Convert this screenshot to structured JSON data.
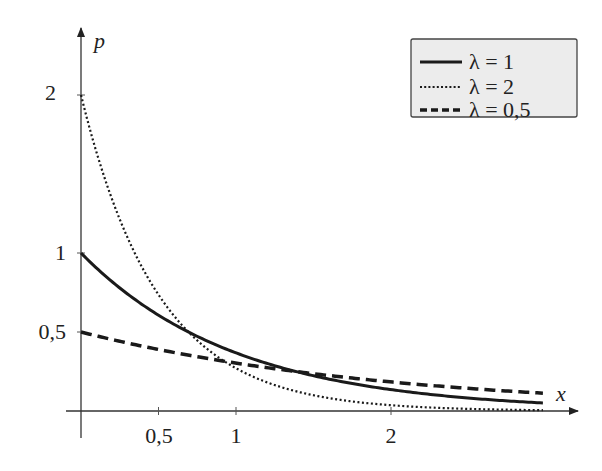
{
  "chart_data": {
    "type": "line",
    "title": "",
    "xlabel": "x",
    "ylabel": "p",
    "xlim": [
      0,
      3.2
    ],
    "ylim": [
      0,
      2.4
    ],
    "x_ticks": [
      0.5,
      1,
      2
    ],
    "x_tick_labels": [
      "0,5",
      "1",
      "2"
    ],
    "y_ticks": [
      0.5,
      1,
      2
    ],
    "y_tick_labels": [
      "0,5",
      "1",
      "2"
    ],
    "grid": false,
    "legend_position": "upper right",
    "function": "p(x) = λ·e^(−λx)",
    "x": [
      0,
      0.25,
      0.5,
      0.75,
      1.0,
      1.25,
      1.5,
      1.75,
      2.0,
      2.25,
      2.5,
      2.75,
      2.98
    ],
    "series": [
      {
        "name": "λ = 1",
        "lambda": 1,
        "style": "solid",
        "values": [
          1.0,
          0.779,
          0.607,
          0.472,
          0.368,
          0.287,
          0.223,
          0.174,
          0.135,
          0.105,
          0.082,
          0.064,
          0.051
        ]
      },
      {
        "name": "λ = 2",
        "lambda": 2,
        "style": "dotted",
        "values": [
          2.0,
          1.213,
          0.736,
          0.446,
          0.271,
          0.164,
          0.1,
          0.06,
          0.037,
          0.022,
          0.013,
          0.008,
          0.005
        ]
      },
      {
        "name": "λ = 0,5",
        "lambda": 0.5,
        "style": "dashed",
        "values": [
          0.5,
          0.441,
          0.389,
          0.344,
          0.303,
          0.268,
          0.236,
          0.208,
          0.184,
          0.162,
          0.143,
          0.126,
          0.113
        ]
      }
    ]
  },
  "axes": {
    "x_label": "x",
    "y_label": "p",
    "x_tick_labels": [
      "0,5",
      "1",
      "2"
    ],
    "y_tick_labels": [
      "0,5",
      "1",
      "2"
    ]
  },
  "legend": {
    "items": [
      {
        "label": "λ = 1",
        "style": "solid"
      },
      {
        "label": "λ = 2",
        "style": "dotted"
      },
      {
        "label": "λ = 0,5",
        "style": "dashed"
      }
    ]
  },
  "colors": {
    "line": "#1a1a1a",
    "axis": "#333333",
    "legend_bg": "#ececec",
    "legend_border": "#444444"
  }
}
